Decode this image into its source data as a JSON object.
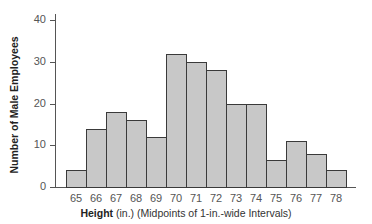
{
  "chart_data": {
    "type": "bar",
    "title": "",
    "xlabel_bold": "Height",
    "xlabel_rest": " (in.) (Midpoints of 1-in.-wide Intervals)",
    "xlabel": "Height (in.) (Midpoints of 1-in.-wide Intervals)",
    "ylabel": "Number of Male Employees",
    "categories": [
      "65",
      "66",
      "67",
      "68",
      "69",
      "70",
      "71",
      "72",
      "73",
      "74",
      "75",
      "76",
      "77",
      "78"
    ],
    "values": [
      4,
      14,
      18,
      16,
      12,
      32,
      30,
      28,
      20,
      20,
      6.5,
      11,
      8,
      4
    ],
    "yticks": [
      "0",
      "10",
      "20",
      "30",
      "40"
    ],
    "ylim": [
      0,
      42
    ],
    "grid": false,
    "histogram": true,
    "bar_color": "#c8c8c8",
    "edge_color": "#3a3a3a"
  }
}
